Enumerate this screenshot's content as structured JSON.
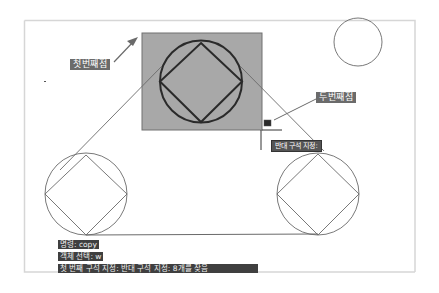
{
  "drawing": {
    "callouts": {
      "first_corner": "첫번째점",
      "second_corner": "두번째점"
    },
    "tooltip": "반대 구석 지정:",
    "command_line": {
      "lines": [
        "명령:   copy",
        "객체 선택: w",
        "첫 번째 구석 지정: 반대 구석 지정: 8개를 찾음"
      ]
    },
    "colors": {
      "selection_fill": "#a8a8a8",
      "selection_border": "#707070",
      "heavy_stroke": "#2a2a2a",
      "thin_stroke": "#6a6a6a",
      "label_bg": "#6b6b6b",
      "command_bg": "#3f3f3f"
    }
  }
}
